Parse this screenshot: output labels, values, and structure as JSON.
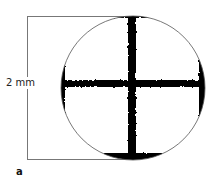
{
  "figure": {
    "panel_label": "a",
    "dimension_label": "2 mm",
    "colors": {
      "ink": "#000000",
      "outline": "#555555",
      "bracket": "#777777",
      "background": "#ffffff"
    }
  }
}
